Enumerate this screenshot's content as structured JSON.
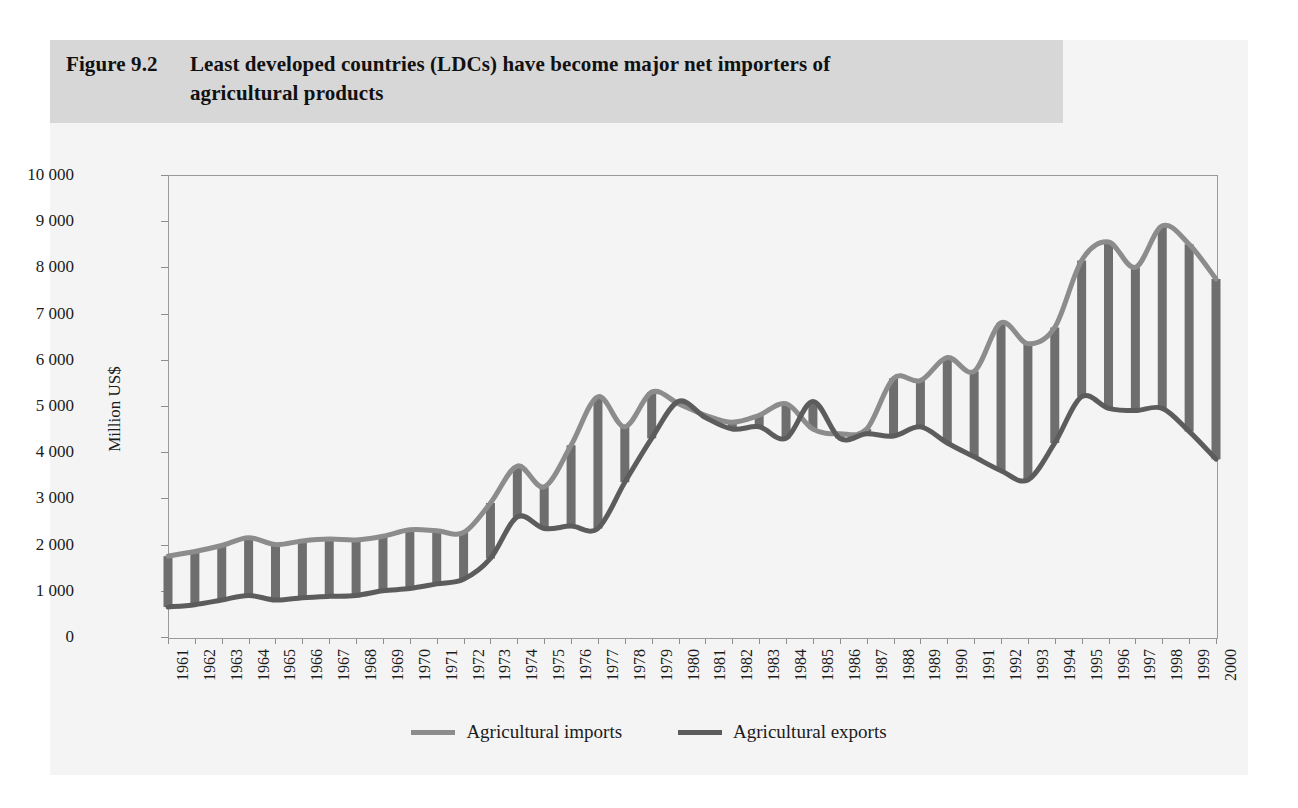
{
  "figure": {
    "number": "Figure 9.2",
    "title_line_1": "Least developed countries (LDCs) have become major net importers of",
    "title_line_2": "agricultural products"
  },
  "colors": {
    "imports_line": "#8c8c8c",
    "exports_line": "#5c5c5c",
    "band_fill": "#6e6e6e",
    "header_band": "#d7d7d7",
    "card_background": "#f4f4f4",
    "axis": "#9a9a9a",
    "text": "#1b1b1b"
  },
  "legend": {
    "position": "bottom-center",
    "entries": [
      {
        "label": "Agricultural imports",
        "color": "#8c8c8c"
      },
      {
        "label": "Agricultural exports",
        "color": "#5c5c5c"
      }
    ]
  },
  "axes": {
    "y_title": "Million US$",
    "y_ticks": [
      "0",
      "1 000",
      "2 000",
      "3 000",
      "4 000",
      "5 000",
      "6 000",
      "7 000",
      "8 000",
      "9 000",
      "10 000"
    ],
    "x_ticks": [
      "1961",
      "1962",
      "1963",
      "1964",
      "1965",
      "1966",
      "1967",
      "1968",
      "1969",
      "1970",
      "1971",
      "1972",
      "1973",
      "1974",
      "1975",
      "1976",
      "1977",
      "1978",
      "1979",
      "1980",
      "1981",
      "1982",
      "1983",
      "1984",
      "1985",
      "1986",
      "1987",
      "1988",
      "1989",
      "1990",
      "1991",
      "1992",
      "1993",
      "1994",
      "1995",
      "1996",
      "1997",
      "1998",
      "1999",
      "2000"
    ]
  },
  "chart_data": {
    "type": "line",
    "title": "Least developed countries (LDCs) have become major net importers of agricultural products",
    "subtitle": "Figure 9.2",
    "xlabel": "",
    "ylabel": "Million US$",
    "ylim": [
      0,
      10000
    ],
    "ytick_step": 1000,
    "grid": false,
    "legend_position": "bottom-center",
    "x": [
      1961,
      1962,
      1963,
      1964,
      1965,
      1966,
      1967,
      1968,
      1969,
      1970,
      1971,
      1972,
      1973,
      1974,
      1975,
      1976,
      1977,
      1978,
      1979,
      1980,
      1981,
      1982,
      1983,
      1984,
      1985,
      1986,
      1987,
      1988,
      1989,
      1990,
      1991,
      1992,
      1993,
      1994,
      1995,
      1996,
      1997,
      1998,
      1999,
      2000
    ],
    "series": [
      {
        "name": "Agricultural imports",
        "color": "#8c8c8c",
        "values": [
          1750,
          1850,
          1980,
          2150,
          2000,
          2080,
          2120,
          2100,
          2180,
          2320,
          2300,
          2260,
          2900,
          3700,
          3250,
          4150,
          5200,
          4550,
          5300,
          5050,
          4800,
          4650,
          4800,
          5050,
          4500,
          4400,
          4500,
          5600,
          5550,
          6050,
          5750,
          6800,
          6350,
          6700,
          8150,
          8550,
          8000,
          8900,
          8500,
          7750
        ]
      },
      {
        "name": "Agricultural exports",
        "color": "#5c5c5c",
        "values": [
          650,
          700,
          800,
          900,
          800,
          850,
          880,
          900,
          1000,
          1050,
          1150,
          1250,
          1700,
          2600,
          2350,
          2400,
          2350,
          3350,
          4300,
          5100,
          4750,
          4500,
          4550,
          4300,
          5100,
          4300,
          4400,
          4350,
          4550,
          4200,
          3900,
          3600,
          3400,
          4200,
          5200,
          4950,
          4900,
          4950,
          4450,
          3850
        ]
      }
    ],
    "annotations": [
      "Vertical hatch lines connect the two series at each year, shading the gap between imports and exports."
    ]
  }
}
